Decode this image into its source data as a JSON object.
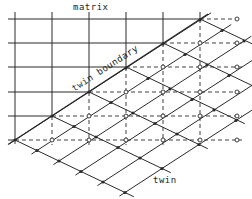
{
  "labels": {
    "matrix": "matrix",
    "twin_boundary": "twin boundary",
    "twin": "twin"
  },
  "colors": {
    "line": "#2a2a2a",
    "background": "#ffffff"
  },
  "geometry": {
    "matrix_x": [
      15,
      52,
      89,
      126,
      163,
      200,
      237
    ],
    "matrix_y": [
      19,
      43,
      67,
      92,
      116,
      140
    ],
    "boundary_nodes": [
      [
        15,
        140
      ],
      [
        52,
        116
      ],
      [
        89,
        92
      ],
      [
        126,
        67
      ],
      [
        163,
        43
      ],
      [
        200,
        19
      ]
    ],
    "twin_row_vector": [
      22,
      10.5
    ],
    "twin_rows_length": 5
  }
}
